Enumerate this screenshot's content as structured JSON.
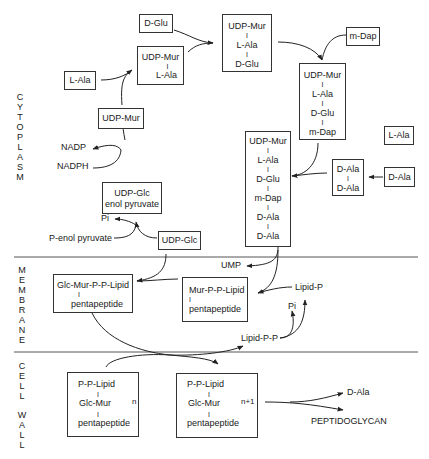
{
  "regions": {
    "cytoplasm": [
      "C",
      "Y",
      "T",
      "O",
      "P",
      "L",
      "A",
      "S",
      "M"
    ],
    "membrane": [
      "M",
      "E",
      "M",
      "B",
      "R",
      "A",
      "N",
      "E"
    ],
    "cell": [
      "C",
      "E",
      "L",
      "L"
    ],
    "wall": [
      "W",
      "A",
      "L",
      "L"
    ]
  },
  "nodes": {
    "d_glu": "D-Glu",
    "udp_mur_lala": [
      "UDP-Mur",
      "I",
      "L-Ala"
    ],
    "l_ala_left": "L-Ala",
    "udp_mur_lala_dglu": [
      "UDP-Mur",
      "I",
      "L-Ala",
      "I",
      "D-Glu"
    ],
    "m_dap": "m-Dap",
    "udp_mur_tetra": [
      "UDP-Mur",
      "I",
      "L-Ala",
      "I",
      "D-Glu",
      "I",
      "m-Dap"
    ],
    "udp_mur": "UDP-Mur",
    "l_ala_right": "L-Ala",
    "d_ala_single": "D-Ala",
    "d_ala_d_ala": [
      "D-Ala",
      "I",
      "D-Ala"
    ],
    "udp_mur_penta": [
      "UDP-Mur",
      "I",
      "L-Ala",
      "I",
      "D-Glu",
      "I",
      "m-Dap",
      "I",
      "D-Ala",
      "I",
      "D-Ala"
    ],
    "udp_glc_enol": [
      "UDP-Glc",
      "enol pyruvate"
    ],
    "udp_glc": "UDP-Glc",
    "glc_mur_ppl": [
      "Glc-Mur-P-P-Lipid",
      "I",
      "pentapeptide"
    ],
    "mur_ppl": [
      "Mur-P-P-Lipid",
      "I",
      "pentapeptide"
    ],
    "cw_n": {
      "top": "P-P-Lipid",
      "bar": "I",
      "inner": [
        "Glc-Mur",
        "I",
        "pentapeptide"
      ],
      "sub": "n"
    },
    "cw_n1": {
      "top": "P-P-Lipid",
      "bar": "I",
      "inner": [
        "Glc-Mur",
        "I",
        "pentapeptide"
      ],
      "sub": "n+1"
    }
  },
  "labels": {
    "nadp": "NADP",
    "nadph": "NADPH",
    "pi_top": "Pi",
    "p_enol_pyruvate": "P-enol pyruvate",
    "ump": "UMP",
    "lipid_p": "Lipid-P",
    "pi_membrane": "Pi",
    "lipid_pp": "Lipid-P-P",
    "d_ala_out": "D-Ala",
    "peptidoglycan": "PEPTIDOGLYCAN"
  },
  "colors": {
    "line": "#333333",
    "text": "#1a1a1a",
    "divider": "#555555"
  }
}
